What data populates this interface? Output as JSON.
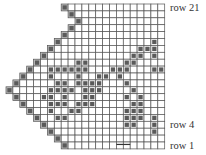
{
  "grid": {
    "rows": 21,
    "cols": 23,
    "cell": 6.9,
    "origin_x": 6,
    "origin_y": 4,
    "line_color": "#555555",
    "fill_color": "#5a5a5a",
    "edge_fill": "#bdbdbd"
  },
  "row_starts": [
    8,
    9,
    10,
    9,
    8,
    7,
    6,
    5,
    4,
    3,
    2,
    1,
    0,
    1,
    2,
    3,
    4,
    5,
    6,
    7,
    8
  ],
  "filled": [
    [
      0,
      8
    ],
    [
      1,
      9
    ],
    [
      2,
      10
    ],
    [
      3,
      9
    ],
    [
      4,
      8
    ],
    [
      5,
      7
    ],
    [
      5,
      21
    ],
    [
      6,
      6
    ],
    [
      6,
      19
    ],
    [
      6,
      20
    ],
    [
      6,
      21
    ],
    [
      7,
      5
    ],
    [
      7,
      18
    ],
    [
      7,
      19
    ],
    [
      7,
      21
    ],
    [
      8,
      4
    ],
    [
      8,
      10
    ],
    [
      8,
      11
    ],
    [
      8,
      17
    ],
    [
      8,
      18
    ],
    [
      9,
      3
    ],
    [
      9,
      6
    ],
    [
      9,
      7
    ],
    [
      9,
      8
    ],
    [
      9,
      9
    ],
    [
      9,
      10
    ],
    [
      9,
      11
    ],
    [
      9,
      15
    ],
    [
      9,
      16
    ],
    [
      9,
      17
    ],
    [
      9,
      21
    ],
    [
      9,
      22
    ],
    [
      10,
      2
    ],
    [
      10,
      6
    ],
    [
      10,
      10
    ],
    [
      10,
      13
    ],
    [
      10,
      14
    ],
    [
      10,
      16
    ],
    [
      11,
      1
    ],
    [
      11,
      7
    ],
    [
      11,
      8
    ],
    [
      11,
      10
    ],
    [
      11,
      11
    ],
    [
      11,
      12
    ],
    [
      11,
      13
    ],
    [
      11,
      17
    ],
    [
      12,
      0
    ],
    [
      12,
      6
    ],
    [
      12,
      7
    ],
    [
      12,
      8
    ],
    [
      12,
      9
    ],
    [
      12,
      11
    ],
    [
      12,
      12
    ],
    [
      12,
      13
    ],
    [
      12,
      18
    ],
    [
      13,
      1
    ],
    [
      13,
      5
    ],
    [
      13,
      6
    ],
    [
      13,
      8
    ],
    [
      13,
      11
    ],
    [
      13,
      12
    ],
    [
      13,
      17
    ],
    [
      13,
      19
    ],
    [
      14,
      2
    ],
    [
      14,
      6
    ],
    [
      14,
      7
    ],
    [
      14,
      8
    ],
    [
      14,
      10
    ],
    [
      14,
      11
    ],
    [
      14,
      12
    ],
    [
      14,
      18
    ],
    [
      14,
      19
    ],
    [
      15,
      3
    ],
    [
      15,
      6
    ],
    [
      15,
      9
    ],
    [
      15,
      10
    ],
    [
      15,
      17
    ],
    [
      15,
      18
    ],
    [
      15,
      19
    ],
    [
      16,
      4
    ],
    [
      16,
      7
    ],
    [
      16,
      8
    ],
    [
      16,
      17
    ],
    [
      16,
      18
    ],
    [
      16,
      19
    ],
    [
      16,
      21
    ],
    [
      17,
      5
    ],
    [
      17,
      17
    ],
    [
      17,
      18
    ],
    [
      17,
      21
    ],
    [
      18,
      6
    ],
    [
      18,
      21
    ],
    [
      19,
      7
    ],
    [
      20,
      8
    ]
  ],
  "labels": {
    "row21": "row 21",
    "row4": "row 4",
    "row1": "row 1"
  },
  "dash": {
    "row": 20,
    "col_from": 16,
    "col_to": 18
  }
}
